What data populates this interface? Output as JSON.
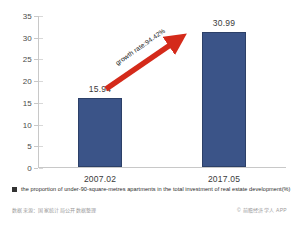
{
  "chart_data": {
    "type": "bar",
    "title": "",
    "subtitle": "",
    "xlabel": "",
    "ylabel": "",
    "categories": [
      "2007.02",
      "2017.05"
    ],
    "values": [
      15.94,
      30.99
    ],
    "value_labels": [
      "15.94",
      "30.99"
    ],
    "series": [
      {
        "name": "the proportion of under-90-square-metres apartments in the total investment of real estate development(%)",
        "values": [
          15.94,
          30.99
        ],
        "color": "#3b5488"
      }
    ],
    "ylim": [
      0,
      35
    ],
    "yticks": [
      0,
      5,
      10,
      15,
      20,
      25,
      30,
      35
    ],
    "ytick_labels": [
      "0",
      "5",
      "10",
      "15",
      "20",
      "25",
      "30",
      "35"
    ],
    "grid": false,
    "legend_position": "bottom-left",
    "annotations": [
      {
        "type": "arrow",
        "text": "growth rate:94.42%",
        "color": "#d42a1a",
        "from": [
          15.94,
          "2007.02"
        ],
        "to": [
          30.99,
          "2017.05"
        ]
      }
    ]
  },
  "legend": {
    "marker_color": "#333333",
    "label": "the proportion of under-90-square-metres apartments in the total investment of real estate development(%)"
  },
  "annotation": {
    "growth_text": "growth rate:94.42%",
    "arrow_color": "#d42a1a"
  },
  "footer": {
    "left": "数据来源：国家统计局公开数据整理",
    "right": "© 前瞻经济学人 APP"
  },
  "colors": {
    "bar_fill": "#3b5488",
    "bar_border": "#2c4068",
    "arrow": "#d42a1a",
    "axis": "#c8c8c8",
    "text": "#3a3a3a",
    "background": "#ffffff"
  }
}
